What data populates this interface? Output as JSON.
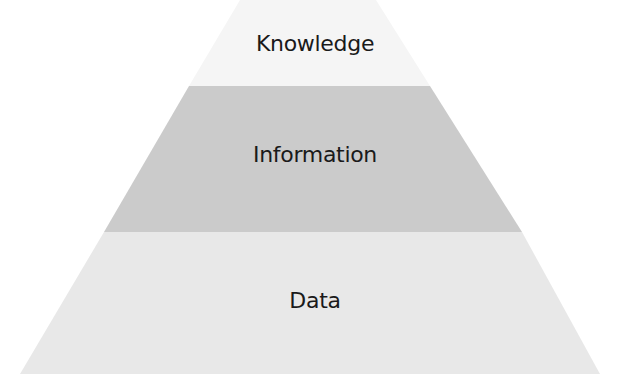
{
  "diagram": {
    "type": "pyramid",
    "tiers": [
      {
        "label": "Knowledge",
        "color": "#f5f5f5",
        "points": "240,0 376,0 430,86 189,86",
        "label_top": 33
      },
      {
        "label": "Information",
        "color": "#cbcbcb",
        "points": "189,86 430,86 522,232 104,232",
        "label_top": 144
      },
      {
        "label": "Data",
        "color": "#e8e8e8",
        "points": "104,232 522,232 600,374 20,374",
        "label_top": 290
      }
    ]
  }
}
